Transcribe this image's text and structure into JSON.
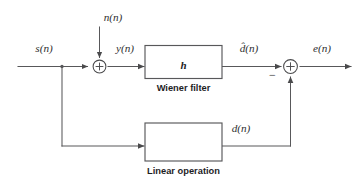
{
  "diagram": {
    "background_color": "#ffffff",
    "line_color": "#58585a",
    "text_color": "#2f2f31",
    "signals": {
      "input": "s(n)",
      "noise": "n(n)",
      "filter_input": "y(n)",
      "filter_output": "d̂(n)",
      "desired": "d(n)",
      "error": "e(n)"
    },
    "blocks": [
      {
        "id": "wiener-filter",
        "inner_label": "h",
        "caption": "Wiener filter"
      },
      {
        "id": "linear-operation",
        "inner_label": "",
        "caption": "Linear operation"
      }
    ],
    "summing_junctions": [
      {
        "id": "noise-adder",
        "symbol": "+",
        "input_signs": [
          "+",
          "+"
        ]
      },
      {
        "id": "error-adder",
        "symbol": "+",
        "input_signs": [
          "−",
          "+"
        ],
        "annotation": "−"
      }
    ]
  }
}
